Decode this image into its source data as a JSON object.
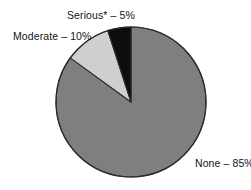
{
  "chart_data": {
    "type": "pie",
    "title": "",
    "subtitle": "",
    "xlabel": "",
    "ylabel": "",
    "legend_position": "none",
    "grid": false,
    "labels_inline": true,
    "start_angle_deg": 90,
    "direction": "counterclockwise",
    "categories": [
      "Serious*",
      "Moderate",
      "None"
    ],
    "values": [
      5,
      10,
      85
    ],
    "units": "%",
    "slices": [
      {
        "name": "Serious*",
        "value": 5,
        "label": "Serious* – 5%",
        "color": "#0d0d0d",
        "start_deg": 90,
        "end_deg": 108
      },
      {
        "name": "Moderate",
        "value": 10,
        "label": "Moderate – 10%",
        "color": "#cfcfcf",
        "start_deg": 108,
        "end_deg": 144
      },
      {
        "name": "None",
        "value": 85,
        "label": "None – 85%",
        "color": "#7f7f7f",
        "start_deg": 144,
        "end_deg": 450
      }
    ],
    "annotations": [
      "*"
    ],
    "colors": {
      "serious": "#0d0d0d",
      "moderate": "#cfcfcf",
      "none": "#7f7f7f",
      "outline": "#2b2b2b",
      "background": "#ffffff",
      "text": "#141414"
    }
  },
  "labels": {
    "serious": "Serious* – 5%",
    "moderate": "Moderate – 10%",
    "none": "None – 85%"
  }
}
